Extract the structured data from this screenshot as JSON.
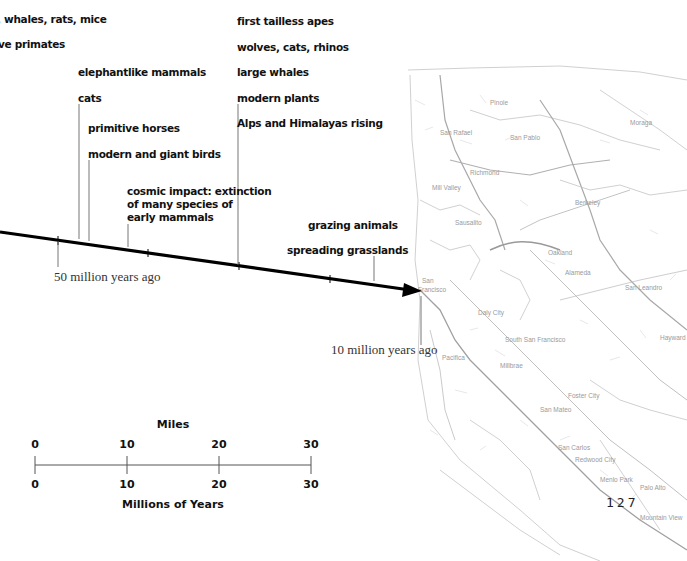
{
  "timeline": {
    "events_left": [
      {
        "id": "whales",
        "label": ", whales, rats, mice"
      },
      {
        "id": "primates",
        "label": "ve primates"
      },
      {
        "id": "elephant",
        "label": "elephantlike mammals"
      },
      {
        "id": "cats",
        "label": "cats"
      },
      {
        "id": "horses",
        "label": "primitive horses"
      },
      {
        "id": "birds",
        "label": "modern and giant birds"
      },
      {
        "id": "cosmic",
        "lines": [
          "cosmic impact: extinction",
          "of many species of",
          "early mammals"
        ]
      }
    ],
    "events_middle": [
      {
        "id": "apes",
        "label": "first tailless apes"
      },
      {
        "id": "wolves",
        "label": "wolves, cats, rhinos"
      },
      {
        "id": "large-whales",
        "label": "large whales"
      },
      {
        "id": "plants",
        "label": "modern plants"
      },
      {
        "id": "alps",
        "label": "Alps and Himalayas rising"
      }
    ],
    "events_right": [
      {
        "id": "grazing",
        "label": "grazing animals"
      },
      {
        "id": "grasslands",
        "label": "spreading grasslands"
      }
    ],
    "marker_50": "50 million years ago",
    "marker_10": "10 million years ago"
  },
  "scale": {
    "top_title": "Miles",
    "bottom_title": "Millions of Years",
    "ticks": [
      "0",
      "10",
      "20",
      "30"
    ]
  },
  "map": {
    "labels": [
      "San Rafael",
      "San Pablo",
      "Berkeley",
      "Oakland",
      "San Francisco",
      "Daly City",
      "South San Francisco",
      "Pacifica",
      "San Mateo",
      "Foster City",
      "San Carlos",
      "Redwood City",
      "Menlo Park",
      "Palo Alto",
      "Mountain View",
      "Alameda",
      "San Leandro",
      "Pinole",
      "Richmond",
      "Mill Valley",
      "Sausalito",
      "Hayward"
    ]
  },
  "page_number": "127"
}
